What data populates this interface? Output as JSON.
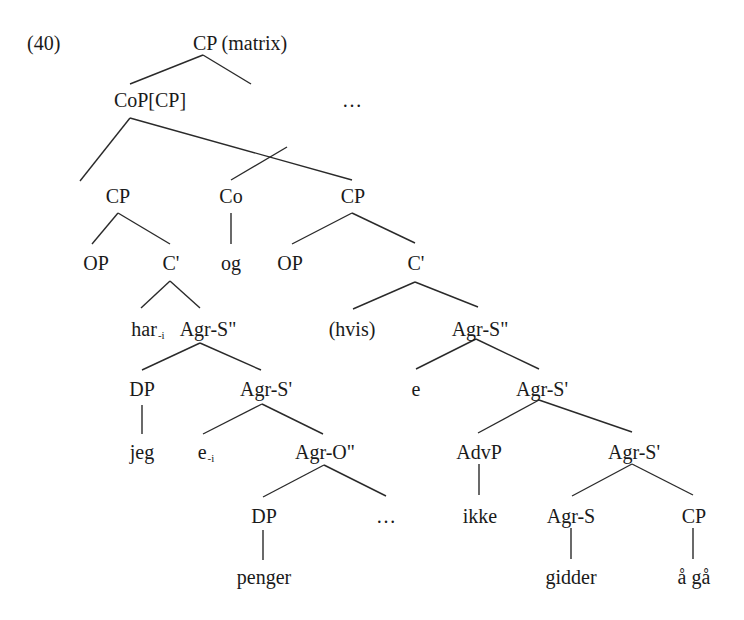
{
  "example_number": "(40)",
  "tree": {
    "root": {
      "label": "CP (matrix)"
    },
    "level1": {
      "cop": "CoP[CP]",
      "ellipsis": "…"
    },
    "level2": {
      "cp_left": "CP",
      "co": "Co",
      "cp_right": "CP"
    },
    "level3": {
      "op_left": "OP",
      "cbar_left": "C'",
      "og": "og",
      "op_right": "OP",
      "cbar_right": "C'"
    },
    "level4": {
      "har": "har",
      "har_index": "-i",
      "agrs2_left": "Agr-S\"",
      "hvis": "(hvis)",
      "agrs2_right": "Agr-S\""
    },
    "level5": {
      "dp_left": "DP",
      "agrs1_left": "Agr-S'",
      "e_right": "e",
      "agrs1_right": "Agr-S'"
    },
    "level6": {
      "jeg": "jeg",
      "e_left": "e",
      "e_left_index": "-i",
      "agro2": "Agr-O\"",
      "advp": "AdvP",
      "agrs1_inner": "Agr-S'"
    },
    "level7": {
      "dp_obj": "DP",
      "ellipsis_obj": "…",
      "ikke": "ikke",
      "agrs_head": "Agr-S",
      "cp_comp": "CP"
    },
    "level8": {
      "penger": "penger",
      "gidder": "gidder",
      "aa_gaa": "å gå"
    }
  }
}
